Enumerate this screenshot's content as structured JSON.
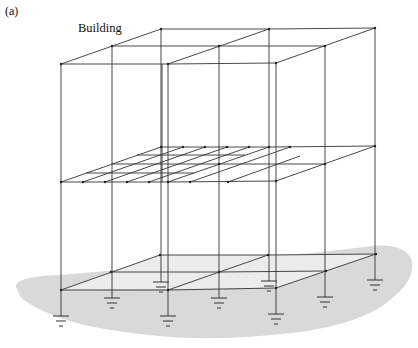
{
  "panel_label": "(a)",
  "title": "Building",
  "colors": {
    "line": "#333333",
    "ground_fill": "#d9d9d9",
    "slab_fill": "#ececec",
    "background": "#ffffff"
  },
  "structure": {
    "stories": 2,
    "bays_x": 2,
    "bays_depth": 2,
    "floors": [
      "ground",
      "middle",
      "roof"
    ],
    "middle_floor_grid": "fine mesh over left bay",
    "supports": "grounded column bases (earth symbols)",
    "support_count": 9
  }
}
